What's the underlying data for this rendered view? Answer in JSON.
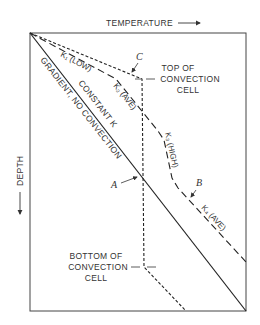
{
  "axes": {
    "x_label": "TEMPERATURE",
    "y_label": "DEPTH",
    "x_arrow": "right-arrow-icon",
    "y_arrow": "down-arrow-icon"
  },
  "lines": {
    "solid": {
      "label_above": "CONSTANT K",
      "label_below": "GRADIENT, NO CONVECTION",
      "style": "solid"
    },
    "layered_k": {
      "style": "long-dash",
      "segments": [
        {
          "label": "K₁ (LOW)"
        },
        {
          "label": "K₂ (AVE)"
        },
        {
          "label": "K₃ (HIGH)"
        },
        {
          "label": "K₄ (AVE)"
        }
      ]
    },
    "convection": {
      "style": "short-dash"
    }
  },
  "markers": {
    "A": "A",
    "B": "B",
    "C": "C"
  },
  "annotations": {
    "top_cell": [
      "TOP OF",
      "CONVECTION",
      "CELL"
    ],
    "bottom_cell": [
      "BOTTOM OF",
      "CONVECTION",
      "CELL"
    ]
  },
  "colors": {
    "ink": "#333333",
    "background": "#ffffff"
  }
}
